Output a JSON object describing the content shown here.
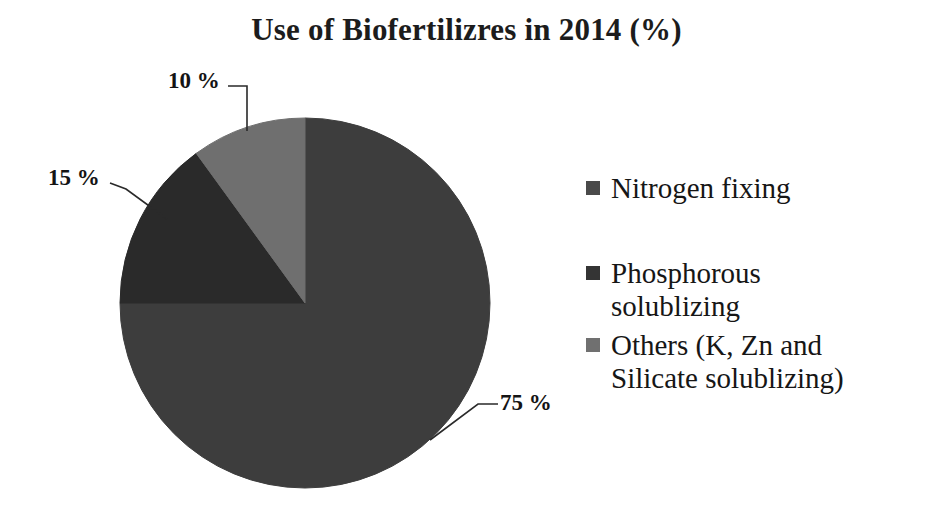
{
  "title": "Use of Biofertilizres in 2014 (%)",
  "background_color": "#ffffff",
  "chart_data": {
    "type": "pie",
    "title": "Use of Biofertilizres in 2014 (%)",
    "xlabel": "",
    "ylabel": "",
    "categories": [
      "Nitrogen fixing",
      "Phosphorous solublizing",
      "Others (K, Zn and Silicate solublizing)"
    ],
    "values": [
      75,
      15,
      10
    ],
    "value_labels": [
      "75 %",
      "15 %",
      "10 %"
    ],
    "colors": [
      "#3d3d3d",
      "#2a2a2a",
      "#6f6f6f"
    ],
    "units": "%",
    "start_angle_deg": 0,
    "direction": "clockwise",
    "legend_position": "right",
    "grid": false,
    "slices": [
      {
        "label": "Nitrogen fixing",
        "value": 75,
        "value_label": "75 %",
        "color": "#3d3d3d",
        "start_deg": 0,
        "end_deg": 270
      },
      {
        "label": "Phosphorous solublizing",
        "value": 15,
        "value_label": "15 %",
        "color": "#2a2a2a",
        "start_deg": 270,
        "end_deg": 324
      },
      {
        "label": "Others (K, Zn and Silicate solublizing)",
        "value": 10,
        "value_label": "10 %",
        "color": "#6f6f6f",
        "start_deg": 324,
        "end_deg": 360
      }
    ]
  },
  "legend": {
    "items": [
      {
        "label": "Nitrogen fixing",
        "line1": "Nitrogen fixing",
        "line2": "",
        "color": "#4a4a4a"
      },
      {
        "label": "Phosphorous solublizing",
        "line1": "Phosphorous",
        "line2": "solublizing",
        "color": "#343434"
      },
      {
        "label": "Others (K, Zn and Silicate solublizing)",
        "line1": "Others (K, Zn and",
        "line2": "Silicate solublizing)",
        "color": "#707070"
      }
    ]
  },
  "callouts": {
    "ten": "10 %",
    "fifteen": "15 %",
    "seventyfive": "75 %"
  }
}
